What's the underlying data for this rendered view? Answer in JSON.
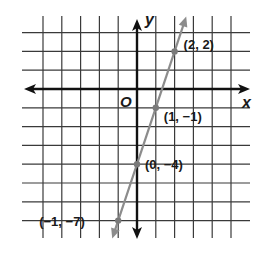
{
  "chart_data": {
    "type": "line",
    "title": "",
    "xlabel": "x",
    "ylabel": "y",
    "origin_label": "O",
    "grid": true,
    "xlim": [
      -5,
      5
    ],
    "ylim": [
      -7,
      3
    ],
    "series": [
      {
        "name": "y = 3x - 4",
        "color": "#8c8c8c",
        "points": [
          {
            "x": -1,
            "y": -7,
            "label": "(−1, −7)"
          },
          {
            "x": 0,
            "y": -4,
            "label": "(0, −4)"
          },
          {
            "x": 1,
            "y": -1,
            "label": "(1, −1)"
          },
          {
            "x": 2,
            "y": 2,
            "label": "(2, 2)"
          }
        ]
      }
    ]
  },
  "colors": {
    "grid": "#3a3a3a",
    "axis": "#111111",
    "line": "#8c8c8c",
    "point": "#7a7a7a"
  }
}
